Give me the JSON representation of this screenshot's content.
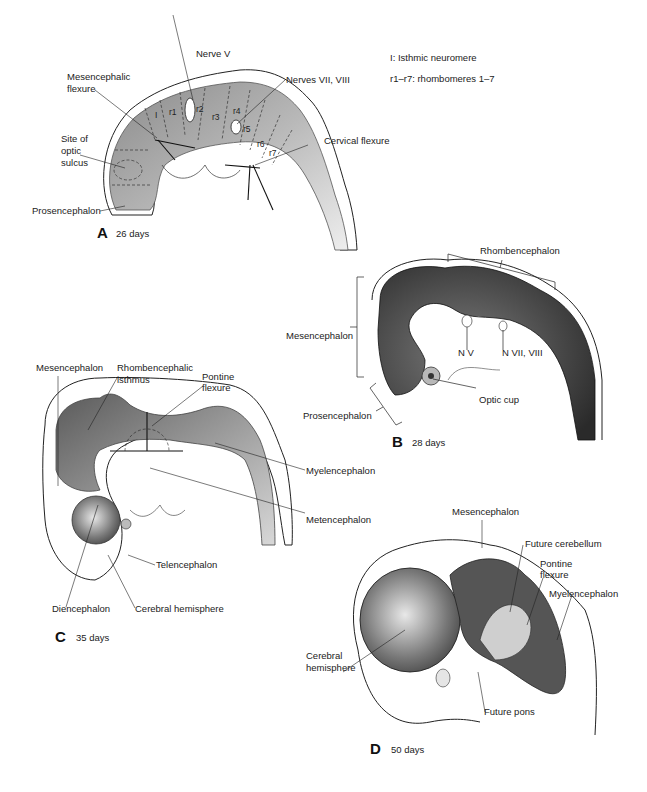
{
  "legend": {
    "isthmic": "I: Isthmic neuromere",
    "rhombomeres": "r1–r7: rhombomeres 1–7"
  },
  "panels": {
    "A": {
      "letter": "A",
      "age": "26 days",
      "labels": {
        "nerve_v": "Nerve V",
        "mesencephalic_flexure_1": "Mesencephalic",
        "mesencephalic_flexure_2": "flexure",
        "nerves_vii_viii": "Nerves VII, VIII",
        "site_optic_1": "Site of",
        "site_optic_2": "optic",
        "site_optic_3": "sulcus",
        "cervical_flexure": "Cervical flexure",
        "prosencephalon": "Prosencephalon"
      },
      "segments": [
        "I",
        "r1",
        "r2",
        "r3",
        "r4",
        "r5",
        "r6",
        "r7"
      ]
    },
    "B": {
      "letter": "B",
      "age": "28 days",
      "labels": {
        "rhombencephalon": "Rhombencephalon",
        "mesencephalon": "Mesencephalon",
        "prosencephalon": "Prosencephalon",
        "n_v": "N V",
        "n_vii_viii": "N VII, VIII",
        "optic_cup": "Optic cup"
      }
    },
    "C": {
      "letter": "C",
      "age": "35 days",
      "labels": {
        "mesencephalon": "Mesencephalon",
        "rhombencephalic_isthmus_1": "Rhombencephalic",
        "rhombencephalic_isthmus_2": "isthmus",
        "pontine_flexure_1": "Pontine",
        "pontine_flexure_2": "flexure",
        "myelencephalon": "Myelencephalon",
        "metencephalon": "Metencephalon",
        "telencephalon": "Telencephalon",
        "diencephalon": "Diencephalon",
        "cerebral_hemisphere": "Cerebral hemisphere"
      }
    },
    "D": {
      "letter": "D",
      "age": "50 days",
      "labels": {
        "mesencephalon": "Mesencephalon",
        "future_cerebellum": "Future cerebellum",
        "pontine_flexure_1": "Pontine",
        "pontine_flexure_2": "flexure",
        "myelencephalon": "Myelencephalon",
        "cerebral_hemisphere_1": "Cerebral",
        "cerebral_hemisphere_2": "hemisphere",
        "future_pons": "Future pons"
      }
    }
  }
}
